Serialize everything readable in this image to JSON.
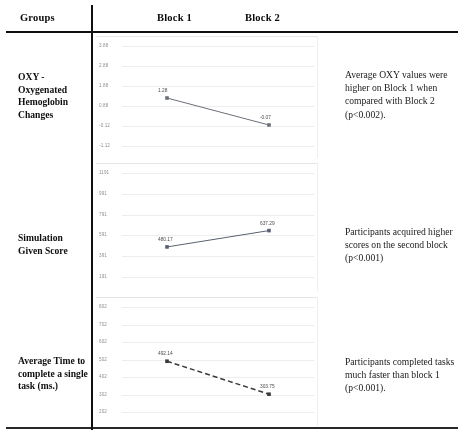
{
  "table": {
    "headers": {
      "groups": "Groups",
      "block1": "Block 1",
      "block2": "Block 2"
    },
    "rows": [
      {
        "label": "OXY - Oxygenated Hemoglobin Changes",
        "note": "Average OXY values were higher on Block 1 when compared with Block 2 (p<0.002)."
      },
      {
        "label": "Simulation Given Score",
        "note": "Participants acquired higher scores on the second block (p<0.001)"
      },
      {
        "label": "Average Time to complete a single task (ms.)",
        "note": "Participants completed tasks much faster than block 1 (p<0.001)."
      }
    ]
  },
  "chart_data": [
    {
      "type": "line",
      "title": "",
      "xlabel": "",
      "ylabel": "",
      "categories": [
        "Block 1",
        "Block 2"
      ],
      "values": [
        1.28,
        -0.07
      ],
      "point_labels": [
        "1.28",
        "-0.07"
      ],
      "yticks": [
        "3.88",
        "2.88",
        "1.88",
        "0.88",
        "-0.12",
        "-1.12"
      ],
      "ytick_values": [
        3.88,
        2.88,
        1.88,
        0.88,
        -0.12,
        -1.12
      ],
      "ylim": [
        -1.12,
        3.88
      ],
      "grid": true,
      "legend": "none",
      "line_style": "solid",
      "marker": "square",
      "color": "#6b6f78"
    },
    {
      "type": "line",
      "title": "",
      "xlabel": "",
      "ylabel": "",
      "categories": [
        "Block 1",
        "Block 2"
      ],
      "values": [
        480.17,
        637.29
      ],
      "point_labels": [
        "480.17",
        "637.29"
      ],
      "yticks": [
        "1191",
        "991",
        "791",
        "591",
        "391",
        "191"
      ],
      "ytick_values": [
        1191,
        991,
        791,
        591,
        391,
        191
      ],
      "ylim": [
        191,
        1191
      ],
      "grid": true,
      "legend": "none",
      "line_style": "solid",
      "marker": "square",
      "color": "#5b6170"
    },
    {
      "type": "line",
      "title": "",
      "xlabel": "",
      "ylabel": "",
      "categories": [
        "Block 1",
        "Block 2"
      ],
      "values": [
        492.14,
        303.75
      ],
      "point_labels": [
        "492.14",
        "303.75"
      ],
      "yticks": [
        "802",
        "702",
        "602",
        "502",
        "402",
        "302",
        "202"
      ],
      "ytick_values": [
        802,
        702,
        602,
        502,
        402,
        302,
        202
      ],
      "ylim": [
        202,
        802
      ],
      "grid": true,
      "legend": "none",
      "line_style": "dashed",
      "marker": "square",
      "color": "#3a3a3a"
    }
  ]
}
